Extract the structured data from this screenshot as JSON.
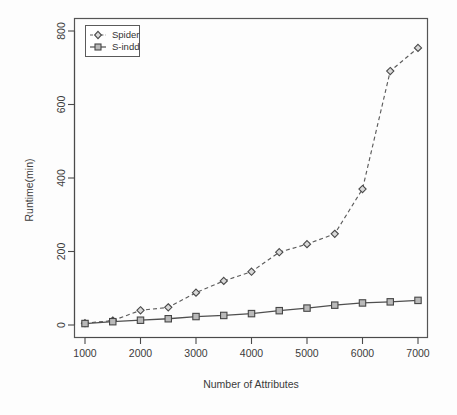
{
  "chart_data": {
    "type": "line",
    "title": "",
    "subtitle": "",
    "xlabel": "Number of Attributes",
    "ylabel": "Runtime(min)",
    "x": [
      1000,
      1500,
      2000,
      2500,
      3000,
      3500,
      4000,
      4500,
      5000,
      5500,
      6000,
      6500,
      7000
    ],
    "xlim": [
      700,
      7300
    ],
    "ylim": [
      -20,
      820
    ],
    "xticks": [
      1000,
      2000,
      3000,
      4000,
      5000,
      6000,
      7000
    ],
    "xtick_labels": [
      "1000",
      "2000",
      "3000",
      "4000",
      "5000",
      "6000",
      "7000"
    ],
    "yticks": [
      0,
      200,
      400,
      600,
      800
    ],
    "ytick_labels": [
      "0",
      "200",
      "400",
      "600",
      "800"
    ],
    "grid": false,
    "legend_position": "top-left",
    "series": [
      {
        "name": "Spider",
        "marker": "diamond",
        "linestyle": "dashed",
        "color": "#5c5c5c",
        "values": [
          5,
          12,
          40,
          48,
          88,
          120,
          145,
          198,
          220,
          248,
          370,
          691,
          754
        ]
      },
      {
        "name": "S-indd",
        "marker": "square",
        "linestyle": "solid",
        "color": "#4f4f4f",
        "values": [
          4,
          9,
          13,
          17,
          23,
          26,
          31,
          39,
          46,
          54,
          60,
          63,
          67
        ]
      }
    ]
  },
  "legend": {
    "entries": [
      {
        "label": "Spider"
      },
      {
        "label": "S-indd"
      }
    ]
  },
  "axes": {
    "x_title": "Number of Attributes",
    "y_title": "Runtime(min)"
  }
}
